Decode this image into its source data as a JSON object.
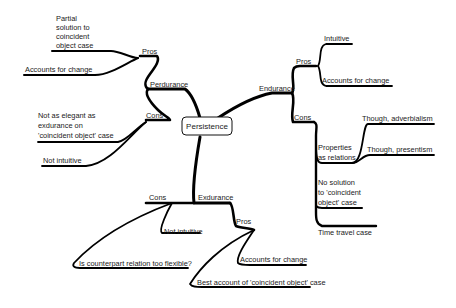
{
  "title": "Persistence",
  "root": {
    "label": "Persistence"
  },
  "branches": {
    "perdurance": {
      "label": "Perdurance",
      "pros": {
        "label": "Pros",
        "items": [
          [
            "Partial",
            "solution to",
            "coincident",
            "object case"
          ],
          [
            "Accounts for change"
          ]
        ]
      },
      "cons": {
        "label": "Cons",
        "items": [
          [
            "Not as elegant as",
            "exdurance on",
            "'coincident object' case"
          ],
          [
            "Not intuitive"
          ]
        ]
      }
    },
    "endurance": {
      "label": "Endurance",
      "pros": {
        "label": "Pros",
        "items": [
          [
            "Intuitive"
          ],
          [
            "Accounts for change"
          ]
        ]
      },
      "cons": {
        "label": "Cons",
        "items": [
          {
            "label": [
              "Properties",
              "as relations"
            ],
            "children": [
              [
                "Though, adverbialism"
              ],
              [
                "Though, presentism"
              ]
            ]
          },
          [
            "No solution",
            "to 'coincident",
            "object' case"
          ],
          [
            "Time travel case"
          ]
        ]
      }
    },
    "exdurance": {
      "label": "Exdurance",
      "pros": {
        "label": "Pros",
        "items": [
          [
            "Accounts for change"
          ],
          [
            "Best account of 'coincident object' case"
          ]
        ]
      },
      "cons": {
        "label": "Cons",
        "items": [
          [
            "Not intuitive"
          ],
          [
            "Is counterpart relation too flexible?"
          ]
        ]
      }
    }
  }
}
